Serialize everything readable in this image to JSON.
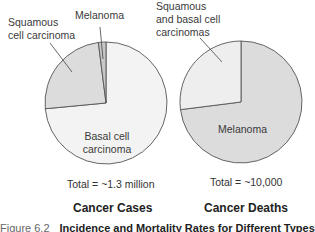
{
  "chart_data": [
    {
      "type": "pie",
      "title": "Cancer Cases",
      "total_label": "Total = ~1.3 million",
      "slices": [
        {
          "label": "Basal cell carcinoma",
          "value": 73.5,
          "color": "#f3f3f3"
        },
        {
          "label": "Squamous cell carcinoma",
          "value": 24.5,
          "color": "#dcdcdc"
        },
        {
          "label": "Melanoma",
          "value": 2.0,
          "color": "#c8c8c8"
        }
      ]
    },
    {
      "type": "pie",
      "title": "Cancer Deaths",
      "total_label": "Total = ~10,000",
      "slices": [
        {
          "label": "Melanoma",
          "value": 73,
          "color": "#dcdcdc"
        },
        {
          "label": "Squamous and basal cell carcinomas",
          "value": 27,
          "color": "#eeeeee"
        }
      ]
    }
  ],
  "left": {
    "label_squamous_1": "Squamous",
    "label_squamous_2": "cell carcinoma",
    "label_melanoma": "Melanoma",
    "label_basal_1": "Basal cell",
    "label_basal_2": "carcinoma",
    "total": "Total = ~1.3 million",
    "title": "Cancer Cases"
  },
  "right": {
    "label_sq_1": "Squamous",
    "label_sq_2": "and basal cell",
    "label_sq_3": "carcinomas",
    "label_melanoma": "Melanoma",
    "total": "Total = ~10,000",
    "title": "Cancer Deaths"
  },
  "caption": {
    "figure": "Figure 6.2",
    "text": "Incidence and Mortality Rates for Different Types of"
  },
  "colors": {
    "outline": "#555555",
    "leader": "#444444"
  }
}
